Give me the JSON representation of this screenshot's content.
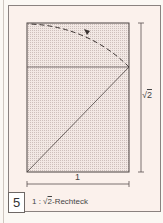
{
  "figure": {
    "number": "5",
    "caption_prefix": "1 : √",
    "caption_radicand": "2",
    "caption_suffix": "-Rechteck",
    "width_label": "1",
    "height_label_root": "√",
    "height_label_radicand": "2"
  },
  "colors": {
    "fill": "#e9dcd8",
    "line": "#5a5250",
    "frame": "#8a8280"
  }
}
